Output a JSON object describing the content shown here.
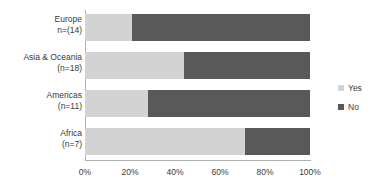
{
  "chart_data": {
    "type": "bar",
    "orientation": "horizontal",
    "stacked": true,
    "normalized": true,
    "title": "",
    "xlabel": "",
    "ylabel": "",
    "xlim": [
      0,
      100
    ],
    "grid": false,
    "legend_position": "right",
    "categories": [
      "Europe\nn=(14)",
      "Asia & Oceania\n(n=18)",
      "Americas\n(n=11)",
      "Africa\n(n=7)"
    ],
    "category_lines": [
      {
        "line1": "Europe",
        "line2": "n=(14)"
      },
      {
        "line1": "Asia & Oceania",
        "line2": "(n=18)"
      },
      {
        "line1": "Americas",
        "line2": "(n=11)"
      },
      {
        "line1": "Africa",
        "line2": "(n=7)"
      }
    ],
    "series": [
      {
        "name": "Yes",
        "color": "#d3d3d3",
        "values": [
          21,
          44,
          28,
          71
        ]
      },
      {
        "name": "No",
        "color": "#595959",
        "values": [
          79,
          56,
          72,
          29
        ]
      }
    ],
    "xticks": [
      "0%",
      "20%",
      "40%",
      "60%",
      "80%",
      "100%"
    ],
    "xtick_values": [
      0,
      20,
      40,
      60,
      80,
      100
    ]
  },
  "legend": {
    "items": [
      {
        "label": "Yes",
        "color": "#d3d3d3"
      },
      {
        "label": "No",
        "color": "#595959"
      }
    ]
  },
  "colors": {
    "yes": "#d3d3d3",
    "no": "#595959",
    "axis": "#b0b0b0",
    "text": "#3a3a3a",
    "background": "#ffffff"
  }
}
